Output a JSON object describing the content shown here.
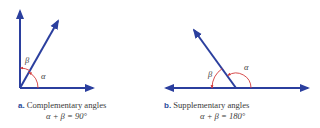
{
  "colors": {
    "ray": "#2b3f9e",
    "arc": "#d23a3a",
    "text": "#3a3a3a",
    "tag": "#2a4a9a"
  },
  "figures": [
    {
      "id": "a",
      "tag": "a.",
      "title": "Complementary angles",
      "equation": "α + β = 90°",
      "angle_labels": {
        "alpha": "α",
        "beta": "β"
      }
    },
    {
      "id": "b",
      "tag": "b.",
      "title": "Supplementary angles",
      "equation": "α + β = 180°",
      "angle_labels": {
        "alpha": "α",
        "beta": "β"
      }
    }
  ]
}
